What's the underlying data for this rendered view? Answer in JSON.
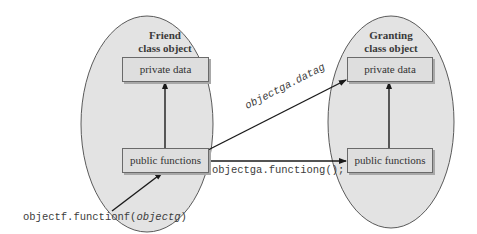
{
  "diagram": {
    "left_object": {
      "title_line1": "Friend",
      "title_line2": "class object",
      "private_box": "private data",
      "public_box": "public functions"
    },
    "right_object": {
      "title_line1": "Granting",
      "title_line2": "class object",
      "private_box": "private data",
      "public_box": "public functions"
    },
    "labels": {
      "data_access": "objectga.datag",
      "function_call": "objectga.functiong();",
      "entry_call_prefix": "objectf.functionf(",
      "entry_call_arg": "objectg",
      "entry_call_suffix": ")"
    },
    "colors": {
      "ellipse_fill": "#e3e3e3",
      "ellipse_stroke": "#5a5a5a",
      "box_fill": "#dedede",
      "arrow": "#1a1a1a"
    }
  }
}
